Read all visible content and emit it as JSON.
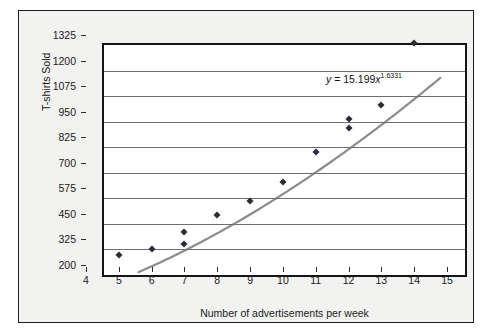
{
  "chart_data": {
    "type": "scatter",
    "title": "",
    "xlabel": "Number of advertisements per week",
    "ylabel": "T-shirts Sold",
    "xlim": [
      4,
      15
    ],
    "ylim": [
      200,
      1325
    ],
    "xticks": [
      4,
      5,
      6,
      7,
      8,
      9,
      10,
      11,
      12,
      13,
      14,
      15
    ],
    "yticks": [
      200,
      325,
      450,
      575,
      700,
      825,
      950,
      1075,
      1200,
      1325
    ],
    "grid": "horizontal",
    "legend": "none",
    "points": [
      {
        "x": 5,
        "y": 250
      },
      {
        "x": 6,
        "y": 278
      },
      {
        "x": 7,
        "y": 305
      },
      {
        "x": 7,
        "y": 360
      },
      {
        "x": 8,
        "y": 443
      },
      {
        "x": 9,
        "y": 512
      },
      {
        "x": 10,
        "y": 607
      },
      {
        "x": 11,
        "y": 752
      },
      {
        "x": 12,
        "y": 868
      },
      {
        "x": 12,
        "y": 912
      },
      {
        "x": 13,
        "y": 985
      },
      {
        "x": 14,
        "y": 1285
      }
    ],
    "trendline": {
      "type": "power",
      "coefficient": 15.199,
      "exponent": 1.6331,
      "equation_prefix": "y",
      "equation_equals": " = ",
      "equation_coef": "15.199",
      "equation_var": "x",
      "equation_exp": "1.6331",
      "x_start": 5.05,
      "x_end": 14.25,
      "color": "#8c8c8c"
    },
    "marker_color": "#2b2b3a",
    "plot_background": "#ffffff",
    "frame_background": "#f2f2f0",
    "gridline_color": "#6e6e6e"
  }
}
